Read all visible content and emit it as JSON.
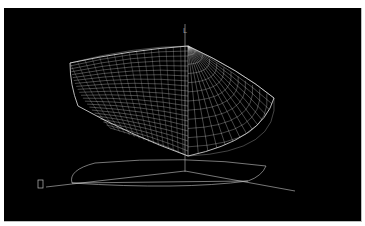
{
  "viewport": {
    "background_color": "#000000",
    "wireframe_color": "#d8d8d8",
    "ground_line_color": "#c8c8c8",
    "content": "3D wireframe hull model (boat hull) with projected waterline outline and axes"
  },
  "axes": {
    "vertical_label": "L",
    "origin_marker": "box-marker"
  }
}
